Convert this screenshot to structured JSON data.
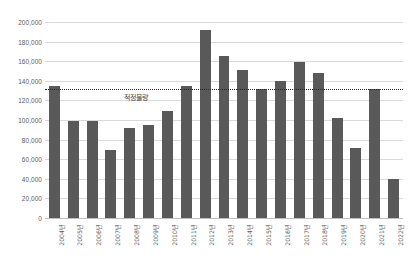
{
  "chart_data": {
    "type": "bar",
    "title": "",
    "xlabel": "",
    "ylabel": "",
    "ylim": [
      0,
      200000
    ],
    "ytick_step": 20000,
    "grid": true,
    "legend": "none",
    "bar_color": "#595959",
    "gridline_color": "#d9d9d9",
    "categories": [
      "2004년",
      "2005년",
      "2006년",
      "2007년",
      "2008년",
      "2009년",
      "2010년",
      "2011년",
      "2012년",
      "2013년",
      "2014년",
      "2015년",
      "2016년",
      "2017년",
      "2018년",
      "2019년",
      "2020년",
      "2021년",
      "2022년"
    ],
    "values": [
      135000,
      99000,
      99000,
      69000,
      92000,
      95000,
      109000,
      135000,
      192000,
      165000,
      151000,
      132000,
      140000,
      159000,
      148000,
      102000,
      71000,
      132000,
      40000
    ],
    "yticks": [
      "0",
      "20,000",
      "40,000",
      "60,000",
      "80,000",
      "100,000",
      "120,000",
      "140,000",
      "160,000",
      "180,000",
      "200,000"
    ],
    "annotations": [
      {
        "name": "reference-line",
        "label": "적정물량",
        "value": 132000,
        "style": "dotted",
        "color": "#262626"
      }
    ]
  }
}
